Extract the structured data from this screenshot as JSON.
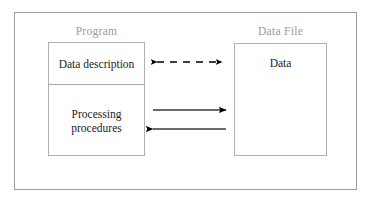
{
  "figure": {
    "background_color": "#ffffff",
    "frame_color": "#9d9d9d",
    "label_color": "#9a9a9a",
    "text_color": "#1c1c1c",
    "arrow_color": "#000000"
  },
  "labels": {
    "program": "Program",
    "data_file": "Data File"
  },
  "program_box": {
    "top_cell": "Data description",
    "bottom_cell": "Processing procedures"
  },
  "data_file_box": {
    "content": "Data"
  },
  "connectors": [
    {
      "id": "dashed-bidirectional",
      "style": "dashed",
      "direction": "both",
      "from": "Data description",
      "to": "Data"
    },
    {
      "id": "solid-right",
      "style": "solid",
      "direction": "right",
      "from": "Processing procedures",
      "to": "Data"
    },
    {
      "id": "solid-left",
      "style": "solid",
      "direction": "left",
      "from": "Data",
      "to": "Processing procedures"
    }
  ]
}
